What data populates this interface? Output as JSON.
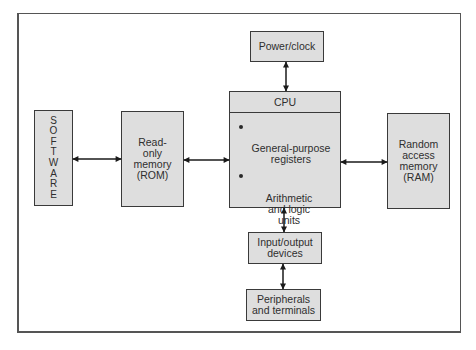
{
  "diagram": {
    "type": "block-diagram",
    "title": "",
    "nodes": [
      {
        "id": "software",
        "label": "SOFTWARE",
        "orientation": "vertical"
      },
      {
        "id": "rom",
        "label": "Read-\nonly\nmemory\n(ROM)"
      },
      {
        "id": "cpu",
        "label": "CPU",
        "items": [
          "General-purpose\nregisters",
          "Arithmetic\nand logic\nunits"
        ]
      },
      {
        "id": "power",
        "label": "Power/clock"
      },
      {
        "id": "ram",
        "label": "Random\naccess\nmemory\n(RAM)"
      },
      {
        "id": "io",
        "label": "Input/output\ndevices"
      },
      {
        "id": "peripherals",
        "label": "Peripherals\nand terminals"
      }
    ],
    "edges": [
      {
        "from": "software",
        "to": "rom",
        "direction": "bidirectional"
      },
      {
        "from": "rom",
        "to": "cpu",
        "direction": "bidirectional"
      },
      {
        "from": "cpu",
        "to": "ram",
        "direction": "bidirectional"
      },
      {
        "from": "power",
        "to": "cpu",
        "direction": "bidirectional"
      },
      {
        "from": "cpu",
        "to": "io",
        "direction": "bidirectional"
      },
      {
        "from": "io",
        "to": "peripherals",
        "direction": "bidirectional"
      }
    ]
  },
  "software_letters": [
    "S",
    "O",
    "F",
    "T",
    "W",
    "A",
    "R",
    "E"
  ],
  "colors": {
    "box_fill": "#dedede",
    "box_border": "#3a3a3a",
    "frame_border": "#555555",
    "arrow": "#1a1a1a",
    "background": "#ffffff"
  }
}
